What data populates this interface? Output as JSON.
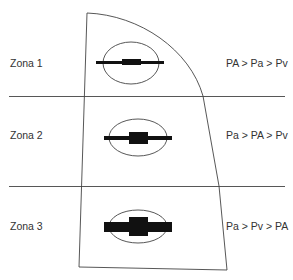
{
  "diagram": {
    "type": "west-lung-zones",
    "colors": {
      "line": "#444444",
      "vessel": "#111111",
      "text": "#333333",
      "background": "#ffffff"
    },
    "zones": [
      {
        "label": "Zona 1",
        "pressure_relation": "PA > Pa > Pv"
      },
      {
        "label": "Zona 2",
        "pressure_relation": "Pa > PA > Pv"
      },
      {
        "label": "Zona 3",
        "pressure_relation": "Pa > Pv > PA"
      }
    ]
  }
}
